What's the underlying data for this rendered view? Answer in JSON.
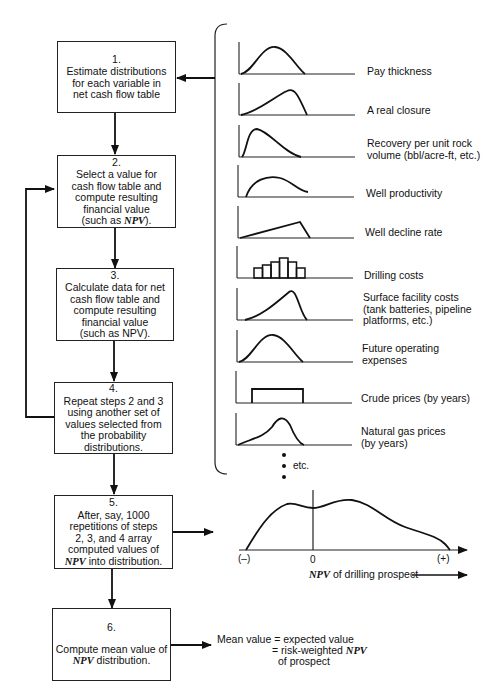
{
  "steps": [
    {
      "number": "1.",
      "lines": [
        "Estimate distributions",
        "for each variable in",
        "net cash flow table"
      ]
    },
    {
      "number": "2.",
      "lines": [
        "Select a value for",
        "cash flow table and",
        "compute resulting",
        "financial value"
      ],
      "last_prefix": "(such as ",
      "last_em": "NPV",
      "last_suffix": ")."
    },
    {
      "number": "3.",
      "lines": [
        "Calculate data for net",
        "cash flow table and",
        "compute resulting",
        "financial value",
        "(such as NPV)."
      ]
    },
    {
      "number": "4.",
      "lines": [
        "Repeat steps 2 and 3",
        "using another set of",
        "values selected from",
        "the probability",
        "distributions."
      ]
    },
    {
      "number": "5.",
      "lines": [
        "After, say, 1000",
        "repetitions of steps",
        "2, 3, and 4  array",
        "computed values of"
      ],
      "last_em": "NPV",
      "last_suffix": " into distribution."
    },
    {
      "number": "6.",
      "lines": [
        "Compute mean value of"
      ],
      "last_em": "NPV",
      "last_suffix": " distribution."
    }
  ],
  "distributions": [
    {
      "label_lines": [
        "Pay thickness"
      ],
      "shape": "bell"
    },
    {
      "label_lines": [
        "A real closure"
      ],
      "shape": "left-skewed"
    },
    {
      "label_lines": [
        "Recovery per unit rock",
        "volume (bbl/acre-ft, etc.)"
      ],
      "shape": "right-skewed"
    },
    {
      "label_lines": [
        "Well productivity"
      ],
      "shape": "arc"
    },
    {
      "label_lines": [
        "Well decline rate"
      ],
      "shape": "triangular"
    },
    {
      "label_lines": [
        "Drilling costs"
      ],
      "shape": "histogram"
    },
    {
      "label_lines": [
        "Surface facility costs",
        "(tank batteries, pipeline",
        "platforms, etc.)"
      ],
      "shape": "steep-left-skewed"
    },
    {
      "label_lines": [
        "Future operating",
        "expenses"
      ],
      "shape": "bell"
    },
    {
      "label_lines": [
        "Crude prices (by years)"
      ],
      "shape": "uniform"
    },
    {
      "label_lines": [
        "Natural gas prices",
        "(by years)"
      ],
      "shape": "shoulder-bell"
    }
  ],
  "etc_label": "etc.",
  "npv_chart": {
    "tick_labels": [
      "(–)",
      "0",
      "(+)"
    ],
    "axis_label_em": "NPV",
    "axis_label_rest": " of drilling prospect"
  },
  "mean_text": {
    "line1": "Mean value = expected value",
    "line2_prefix": "= risk-weighted ",
    "line2_em": "NPV",
    "line3": "of prospect"
  }
}
